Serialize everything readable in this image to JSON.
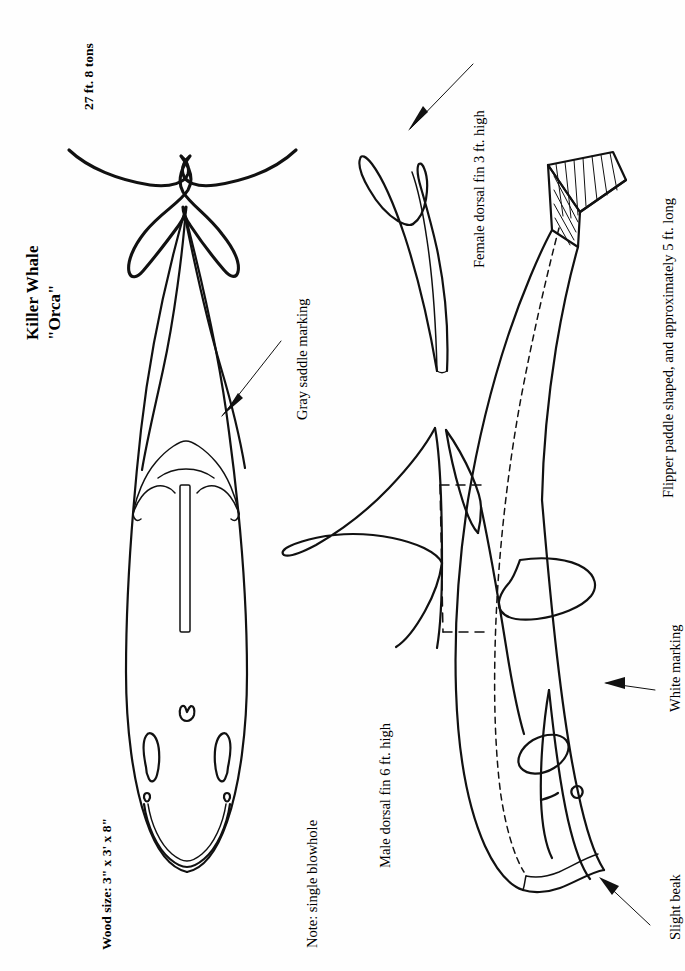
{
  "document": {
    "kind": "woodcarving-pattern-plate",
    "orientation": "text rotated 90 degrees counter-clockwise",
    "background_color": "#ffffff",
    "ink_color": "#111111"
  },
  "title": {
    "main": "Killer Whale",
    "sub": "\"Orca\""
  },
  "specs": {
    "size_weight": "27 ft. 8 tons",
    "wood_size": "Wood size: 3\" x 3' x 8\""
  },
  "callouts": {
    "gray_saddle": "Gray saddle marking",
    "blowhole_note": "Note: single blowhole",
    "male_dorsal": "Male dorsal fin 6 ft. high",
    "female_dorsal": "Female dorsal fin 3 ft. high",
    "flipper": "Flipper paddle shaped, and approximately 5 ft. long",
    "white_marking": "White marking",
    "slight_beak": "Slight beak"
  },
  "figures": [
    {
      "id": "top-view",
      "name": "Killer whale dorsal (top) view pattern",
      "features": [
        "tail flukes",
        "gray saddle marking",
        "dorsal fin slot",
        "single blowhole",
        "eye patches",
        "mouth line"
      ]
    },
    {
      "id": "female-dorsal-fin",
      "name": "Female dorsal fin profile pattern"
    },
    {
      "id": "male-dorsal-fin",
      "name": "Male dorsal fin profile pattern"
    },
    {
      "id": "side-view",
      "name": "Killer whale lateral (side) view pattern",
      "features": [
        "hatched cut tail stock",
        "dorsal fin outline",
        "flipper",
        "eye patch",
        "white marking",
        "slight beak",
        "center dashed line"
      ]
    }
  ],
  "icons": {
    "arrow": "arrow-pointer-icon"
  }
}
